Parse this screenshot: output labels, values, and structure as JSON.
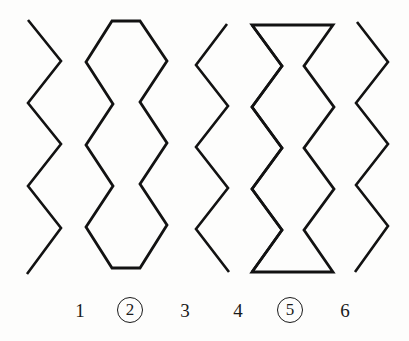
{
  "page": {
    "background_color": "#fdfdfc",
    "stroke_color": "#121212",
    "width": 409,
    "height": 341
  },
  "labels": [
    {
      "text": "1",
      "circled": false,
      "x": 60
    },
    {
      "text": "2",
      "circled": true,
      "x": 110
    },
    {
      "text": "3",
      "circled": false,
      "x": 165
    },
    {
      "text": "4",
      "circled": false,
      "x": 218
    },
    {
      "text": "5",
      "circled": true,
      "x": 270
    },
    {
      "text": "6",
      "circled": false,
      "x": 325
    }
  ],
  "chart_data": {
    "type": "line",
    "title": "",
    "xlabel": "",
    "ylabel": "",
    "grid": false,
    "legend": "none",
    "figures": [
      {
        "id": 1,
        "label": "1",
        "closed": false,
        "stroke_color": "#121212",
        "points": [
          [
            28,
            20
          ],
          [
            61,
            61
          ],
          [
            28,
            103
          ],
          [
            61,
            144
          ],
          [
            28,
            186
          ],
          [
            61,
            228
          ],
          [
            27,
            274
          ]
        ]
      },
      {
        "id": 2,
        "label": "2",
        "closed": true,
        "stroke_color": "#121212",
        "points": [
          [
            112,
            21
          ],
          [
            140,
            21
          ],
          [
            167,
            61
          ],
          [
            140,
            102
          ],
          [
            167,
            143
          ],
          [
            140,
            184
          ],
          [
            167,
            225
          ],
          [
            140,
            268
          ],
          [
            112,
            268
          ],
          [
            86,
            227
          ],
          [
            113,
            186
          ],
          [
            86,
            145
          ],
          [
            113,
            104
          ],
          [
            86,
            62
          ]
        ]
      },
      {
        "id": 3,
        "label": "3",
        "closed": false,
        "stroke_color": "#121212",
        "points": [
          [
            227,
            24
          ],
          [
            196,
            65
          ],
          [
            228,
            106
          ],
          [
            196,
            147
          ],
          [
            228,
            188
          ],
          [
            196,
            229
          ],
          [
            229,
            272
          ]
        ]
      },
      {
        "id": 4,
        "label": "4",
        "closed": false,
        "stroke_color": "#121212",
        "points": [
          [
            252,
            25
          ],
          [
            282,
            66
          ],
          [
            252,
            107
          ],
          [
            282,
            148
          ],
          [
            252,
            189
          ],
          [
            282,
            230
          ],
          [
            252,
            272
          ]
        ]
      },
      {
        "id": 5,
        "label": "5",
        "closed": true,
        "stroke_color": "#121212",
        "points": [
          [
            252,
            25
          ],
          [
            333,
            25
          ],
          [
            304,
            66
          ],
          [
            334,
            107
          ],
          [
            304,
            148
          ],
          [
            334,
            189
          ],
          [
            304,
            230
          ],
          [
            333,
            272
          ],
          [
            252,
            272
          ],
          [
            282,
            230
          ],
          [
            252,
            189
          ],
          [
            282,
            148
          ],
          [
            252,
            107
          ],
          [
            282,
            66
          ]
        ]
      },
      {
        "id": 6,
        "label": "6",
        "closed": false,
        "stroke_color": "#121212",
        "points": [
          [
            357,
            22
          ],
          [
            388,
            62
          ],
          [
            356,
            103
          ],
          [
            388,
            144
          ],
          [
            356,
            185
          ],
          [
            388,
            226
          ],
          [
            355,
            272
          ]
        ]
      }
    ]
  }
}
